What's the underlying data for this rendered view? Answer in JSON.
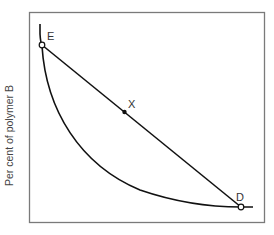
{
  "diagram": {
    "y_axis_label": "Per cent of polymer B",
    "x_axis_label": "",
    "points": {
      "E": {
        "label": "E",
        "style": "open-circle"
      },
      "X": {
        "label": "X",
        "style": "filled-dot"
      },
      "D": {
        "label": "D",
        "style": "open-circle"
      }
    },
    "elements": [
      "frame",
      "concave-curve",
      "tie-line E-D through X"
    ],
    "colors": {
      "line": "#111111",
      "frame": "#777777",
      "text": "#444444"
    }
  }
}
